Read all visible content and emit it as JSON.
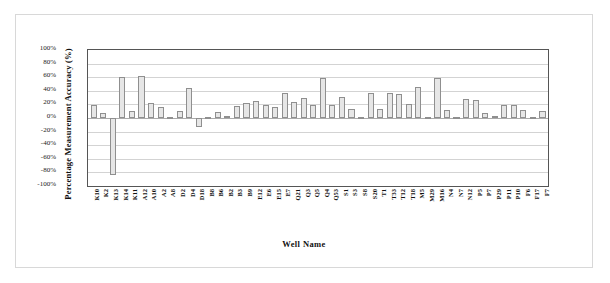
{
  "chart_data": {
    "type": "bar",
    "title": "",
    "xlabel": "Well Name",
    "ylabel": "Percentage Measurement Accuracy (%)",
    "ylim": [
      -100,
      100
    ],
    "ytick_labels": [
      "100%",
      "80%",
      "60%",
      "40%",
      "20%",
      "0%",
      "-20%",
      "-40%",
      "-60%",
      "-80%",
      "-100%"
    ],
    "ytick_values": [
      100,
      80,
      60,
      40,
      20,
      0,
      -20,
      -40,
      -60,
      -80,
      -100
    ],
    "grid": true,
    "legend": false,
    "bar_fill_color": "#e6e6e6",
    "bar_border_color": "#8f8f8f",
    "categories": [
      "K10",
      "K2",
      "K13",
      "K14",
      "K11",
      "A12",
      "A10",
      "A2",
      "A8",
      "D2",
      "D4",
      "D18",
      "B8",
      "B6",
      "B2",
      "B3",
      "B9",
      "E12",
      "E6",
      "E15",
      "E7",
      "Q21",
      "Q3",
      "Q5",
      "Q4",
      "Q53",
      "S1",
      "S3",
      "S8",
      "S20",
      "T1",
      "T33",
      "T12",
      "T18",
      "M5",
      "M29",
      "M16",
      "N4",
      "N7",
      "N12",
      "P5",
      "P7",
      "P29",
      "P11",
      "P10",
      "F6",
      "F17",
      "F7"
    ],
    "values": [
      20,
      8,
      -85,
      61,
      10,
      62,
      22,
      16,
      2,
      10,
      45,
      -13,
      1,
      9,
      3,
      18,
      22,
      25,
      20,
      16,
      38,
      24,
      30,
      20,
      59,
      20,
      32,
      14,
      2,
      37,
      13,
      38,
      36,
      21,
      47,
      1,
      60,
      12,
      2,
      29,
      27,
      8,
      3,
      19,
      20,
      12,
      2,
      10
    ]
  }
}
